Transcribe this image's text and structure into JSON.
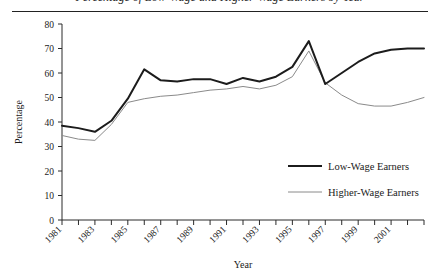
{
  "figure": {
    "title": "Percentage of Low-Wage and Higher-Wage Earners by Year",
    "title_visible_note": "title row is cropped at the top edge of the screenshot"
  },
  "chart_data": {
    "type": "line",
    "title": "Percentage of Low-Wage and Higher-Wage Earners by Year",
    "xlabel": "Year",
    "ylabel": "Percentage",
    "xlim": [
      1981,
      2003
    ],
    "ylim": [
      0,
      80
    ],
    "yticks": [
      0,
      10,
      20,
      30,
      40,
      50,
      60,
      70,
      80
    ],
    "ytick_labels": [
      "0",
      "10",
      "20",
      "30",
      "40",
      "50",
      "60",
      "70",
      "80"
    ],
    "xticks": [
      1981,
      1982,
      1983,
      1984,
      1985,
      1986,
      1987,
      1988,
      1989,
      1990,
      1991,
      1992,
      1993,
      1994,
      1995,
      1996,
      1997,
      1998,
      1999,
      2000,
      2001,
      2002,
      2003
    ],
    "xtick_labels_shown": [
      "1981",
      "1983",
      "1985",
      "1987",
      "1989",
      "1991",
      "1993",
      "1995",
      "1997",
      "1999",
      "2001"
    ],
    "xtick_label_rotation_deg": 45,
    "grid": false,
    "legend_position": "lower right inside plot",
    "x": [
      1981,
      1982,
      1983,
      1984,
      1985,
      1986,
      1987,
      1988,
      1989,
      1990,
      1991,
      1992,
      1993,
      1994,
      1995,
      1996,
      1997,
      1998,
      1999,
      2000,
      2001,
      2002,
      2003
    ],
    "series": [
      {
        "name": "Low-Wage Earners",
        "color": "#1c1c1c",
        "line_width": 2,
        "values": [
          38.5,
          37.5,
          36.0,
          40.5,
          49.5,
          61.5,
          57.0,
          56.5,
          57.5,
          57.5,
          55.5,
          58.0,
          56.5,
          58.5,
          62.5,
          73.0,
          55.5,
          60.0,
          64.5,
          68.0,
          69.5,
          70.0,
          70.0
        ]
      },
      {
        "name": "Higher-Wage Earners",
        "color": "#8a8a8a",
        "line_width": 1,
        "values": [
          34.5,
          33.0,
          32.5,
          39.0,
          48.0,
          49.5,
          50.5,
          51.0,
          52.0,
          53.0,
          53.5,
          54.5,
          53.5,
          55.0,
          58.5,
          69.0,
          56.0,
          51.0,
          47.5,
          46.5,
          46.5,
          48.0,
          50.0
        ]
      }
    ]
  },
  "legend": {
    "items": [
      {
        "label": "Low-Wage Earners",
        "color": "#1c1c1c"
      },
      {
        "label": "Higher-Wage Earners",
        "color": "#8a8a8a"
      }
    ]
  },
  "axes": {
    "y_title": "Percentage",
    "x_title": "Year"
  }
}
